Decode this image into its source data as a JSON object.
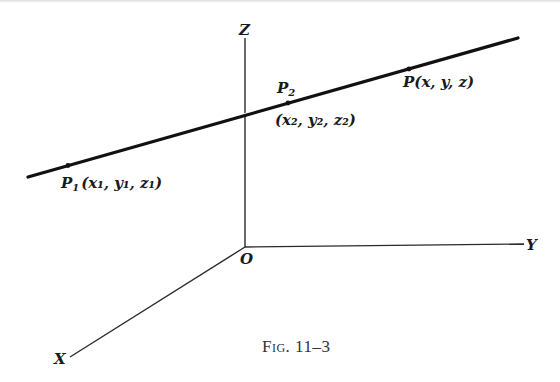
{
  "figure": {
    "caption": "Fig. 11–3",
    "axes": {
      "origin_label": "O",
      "x_label": "X",
      "y_label": "Y",
      "z_label": "Z"
    },
    "line": {
      "description": "straight line through P1 and P2 in 3D space",
      "points": [
        {
          "id": "P1",
          "label_name": "P",
          "label_sub": "1",
          "coords": "(x₁, y₁, z₁)"
        },
        {
          "id": "P2",
          "label_name": "P",
          "label_sub": "2",
          "coords": "(x₂, y₂, z₂)"
        },
        {
          "id": "P",
          "label_name": "P",
          "label_sub": "",
          "coords": "(x, y, z)"
        }
      ]
    },
    "colors": {
      "ink": "#111111",
      "axis": "#2a2a2a",
      "caption": "#333333",
      "background": "#ffffff"
    }
  }
}
